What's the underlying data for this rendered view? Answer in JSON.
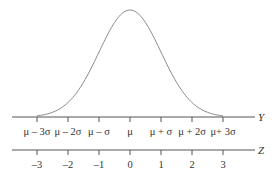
{
  "diagram": {
    "title": "",
    "curve": "normal-distribution",
    "axes": [
      {
        "name": "Y",
        "ticks": [
          "μ – 3σ",
          "μ – 2σ",
          "μ – σ",
          "μ",
          "μ + σ",
          "μ + 2σ",
          "μ+ 3σ"
        ]
      },
      {
        "name": "Z",
        "ticks": [
          "–3",
          "–2",
          "–1",
          "0",
          "1",
          "2",
          "3"
        ]
      }
    ],
    "colors": {
      "line": "#555555",
      "curve": "#8a8a8a",
      "text": "#333333"
    }
  }
}
